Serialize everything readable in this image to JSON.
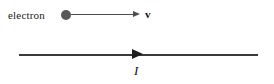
{
  "figure": {
    "background_color": "#ffffff"
  },
  "particle": {
    "label": "electron",
    "marker": "filled-circle",
    "marker_color": "#585858"
  },
  "velocity": {
    "label": "v",
    "style": "bold",
    "arrow_direction": "right",
    "arrow_color": "#4d4d4d"
  },
  "wire": {
    "current_label": "I",
    "current_label_style": "italic",
    "arrow_direction": "right",
    "line_color": "#3a3a3a",
    "arrow_color": "#1f1f1f"
  }
}
